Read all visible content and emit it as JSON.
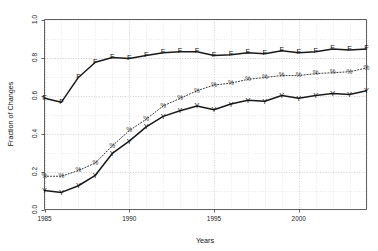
{
  "chart_data": {
    "type": "line",
    "title": "",
    "xlabel": "Years",
    "ylabel": "Fraction of Changes",
    "xlim": [
      1985,
      2004
    ],
    "ylim": [
      0.0,
      1.0
    ],
    "grid": true,
    "legend": "none",
    "x_ticks": [
      "1985",
      "1990",
      "1995",
      "2000"
    ],
    "x_tick_values": [
      1985,
      1990,
      1995,
      2000
    ],
    "y_ticks": [
      "0.0",
      "0.2",
      "0.4",
      "0.6",
      "0.8",
      "1.0"
    ],
    "y_tick_values": [
      0.0,
      0.2,
      0.4,
      0.6,
      0.8,
      1.0
    ],
    "x": [
      1985,
      1986,
      1987,
      1988,
      1989,
      1990,
      1991,
      1992,
      1993,
      1994,
      1995,
      1996,
      1997,
      1998,
      1999,
      2000,
      2001,
      2002,
      2003,
      2004
    ],
    "series": [
      {
        "name": "F",
        "marker": "F",
        "style": "solid",
        "values": [
          0.585,
          0.565,
          0.695,
          0.775,
          0.8,
          0.795,
          0.81,
          0.825,
          0.83,
          0.83,
          0.81,
          0.815,
          0.825,
          0.82,
          0.835,
          0.825,
          0.83,
          0.845,
          0.84,
          0.845
        ]
      },
      {
        "name": "%",
        "marker": "%",
        "style": "dotted",
        "values": [
          0.175,
          0.175,
          0.205,
          0.245,
          0.335,
          0.415,
          0.475,
          0.545,
          0.585,
          0.625,
          0.655,
          0.665,
          0.685,
          0.695,
          0.705,
          0.705,
          0.715,
          0.72,
          0.725,
          0.745
        ]
      },
      {
        "name": "Y",
        "marker": "Y",
        "style": "solid",
        "values": [
          0.1,
          0.09,
          0.125,
          0.18,
          0.295,
          0.36,
          0.435,
          0.49,
          0.52,
          0.545,
          0.525,
          0.555,
          0.575,
          0.57,
          0.6,
          0.585,
          0.6,
          0.61,
          0.605,
          0.625
        ]
      }
    ]
  },
  "axes": {
    "y_axis_title": "Fraction of Changes",
    "x_axis_title": "Years"
  }
}
